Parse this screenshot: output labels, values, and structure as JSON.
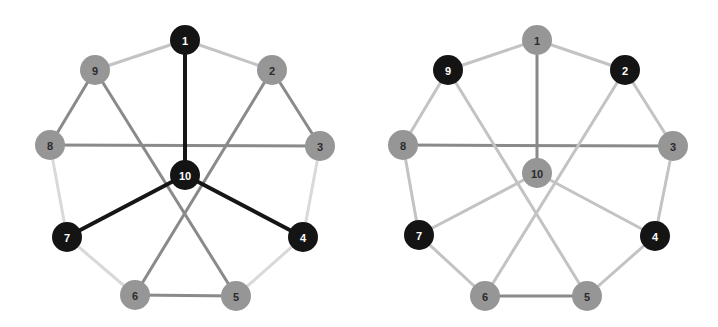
{
  "figure": {
    "title": "",
    "background_color": "#ffffff",
    "width": 718,
    "height": 327,
    "panel_count": 2
  },
  "palette": {
    "node_dark": "#141414",
    "node_gray": "#969696",
    "label_on_dark": "#ffffff",
    "label_on_gray": "#2b2b2b",
    "edge_dark": "#161616",
    "edge_medium": "#8a8a8a",
    "edge_light": "#c3c3c3",
    "edge_faint": "#d9d9d9"
  },
  "chart_data": {
    "type": "diagram",
    "subtype": "node-link-graph",
    "title": "",
    "xlabel": "",
    "ylabel": "",
    "grid": false,
    "legend": null,
    "panels": [
      {
        "panel_id": "left",
        "name": "left-graph",
        "node_radius": 15,
        "nodes": [
          {
            "id": "1",
            "label": "1",
            "x": 185,
            "y": 40,
            "fill": "dark",
            "text": "light"
          },
          {
            "id": "2",
            "label": "2",
            "x": 272,
            "y": 70,
            "fill": "gray",
            "text": "dark"
          },
          {
            "id": "3",
            "label": "3",
            "x": 320,
            "y": 146,
            "fill": "gray",
            "text": "dark"
          },
          {
            "id": "4",
            "label": "4",
            "x": 303,
            "y": 237,
            "fill": "dark",
            "text": "light"
          },
          {
            "id": "5",
            "label": "5",
            "x": 236,
            "y": 296,
            "fill": "gray",
            "text": "dark"
          },
          {
            "id": "6",
            "label": "6",
            "x": 135,
            "y": 295,
            "fill": "gray",
            "text": "dark"
          },
          {
            "id": "7",
            "label": "7",
            "x": 67,
            "y": 237,
            "fill": "dark",
            "text": "light"
          },
          {
            "id": "8",
            "label": "8",
            "x": 50,
            "y": 145,
            "fill": "gray",
            "text": "dark"
          },
          {
            "id": "9",
            "label": "9",
            "x": 95,
            "y": 70,
            "fill": "gray",
            "text": "dark"
          },
          {
            "id": "10",
            "label": "10",
            "x": 185,
            "y": 175,
            "fill": "dark",
            "text": "light"
          }
        ],
        "edges": [
          {
            "from": "1",
            "to": "2",
            "shade": "edge_light",
            "width": 3
          },
          {
            "from": "1",
            "to": "9",
            "shade": "edge_light",
            "width": 3
          },
          {
            "from": "2",
            "to": "3",
            "shade": "edge_medium",
            "width": 3
          },
          {
            "from": "3",
            "to": "4",
            "shade": "edge_faint",
            "width": 3
          },
          {
            "from": "4",
            "to": "5",
            "shade": "edge_faint",
            "width": 3
          },
          {
            "from": "5",
            "to": "6",
            "shade": "edge_medium",
            "width": 3
          },
          {
            "from": "6",
            "to": "7",
            "shade": "edge_faint",
            "width": 3
          },
          {
            "from": "7",
            "to": "8",
            "shade": "edge_faint",
            "width": 3
          },
          {
            "from": "8",
            "to": "9",
            "shade": "edge_medium",
            "width": 3
          },
          {
            "from": "8",
            "to": "3",
            "shade": "edge_medium",
            "width": 3
          },
          {
            "from": "9",
            "to": "5",
            "shade": "edge_medium",
            "width": 3
          },
          {
            "from": "2",
            "to": "6",
            "shade": "edge_medium",
            "width": 3
          },
          {
            "from": "10",
            "to": "1",
            "shade": "edge_dark",
            "width": 4
          },
          {
            "from": "10",
            "to": "4",
            "shade": "edge_dark",
            "width": 4
          },
          {
            "from": "10",
            "to": "7",
            "shade": "edge_dark",
            "width": 4
          }
        ]
      },
      {
        "panel_id": "right",
        "name": "right-graph",
        "node_radius": 15,
        "nodes": [
          {
            "id": "1",
            "label": "1",
            "x": 178,
            "y": 40,
            "fill": "gray",
            "text": "dark"
          },
          {
            "id": "2",
            "label": "2",
            "x": 266,
            "y": 70,
            "fill": "dark",
            "text": "light"
          },
          {
            "id": "3",
            "label": "3",
            "x": 314,
            "y": 146,
            "fill": "gray",
            "text": "dark"
          },
          {
            "id": "4",
            "label": "4",
            "x": 296,
            "y": 236,
            "fill": "dark",
            "text": "light"
          },
          {
            "id": "5",
            "label": "5",
            "x": 228,
            "y": 296,
            "fill": "gray",
            "text": "dark"
          },
          {
            "id": "6",
            "label": "6",
            "x": 126,
            "y": 296,
            "fill": "gray",
            "text": "dark"
          },
          {
            "id": "7",
            "label": "7",
            "x": 60,
            "y": 235,
            "fill": "dark",
            "text": "light"
          },
          {
            "id": "8",
            "label": "8",
            "x": 44,
            "y": 145,
            "fill": "gray",
            "text": "dark"
          },
          {
            "id": "9",
            "label": "9",
            "x": 89,
            "y": 70,
            "fill": "dark",
            "text": "light"
          },
          {
            "id": "10",
            "label": "10",
            "x": 178,
            "y": 173,
            "fill": "gray",
            "text": "dark"
          }
        ],
        "edges": [
          {
            "from": "1",
            "to": "2",
            "shade": "edge_light",
            "width": 3
          },
          {
            "from": "1",
            "to": "9",
            "shade": "edge_light",
            "width": 3
          },
          {
            "from": "2",
            "to": "3",
            "shade": "edge_light",
            "width": 3
          },
          {
            "from": "3",
            "to": "4",
            "shade": "edge_light",
            "width": 3
          },
          {
            "from": "4",
            "to": "5",
            "shade": "edge_light",
            "width": 3
          },
          {
            "from": "5",
            "to": "6",
            "shade": "edge_medium",
            "width": 3
          },
          {
            "from": "6",
            "to": "7",
            "shade": "edge_light",
            "width": 3
          },
          {
            "from": "7",
            "to": "8",
            "shade": "edge_light",
            "width": 3
          },
          {
            "from": "8",
            "to": "9",
            "shade": "edge_light",
            "width": 3
          },
          {
            "from": "8",
            "to": "3",
            "shade": "edge_medium",
            "width": 3
          },
          {
            "from": "9",
            "to": "5",
            "shade": "edge_light",
            "width": 3
          },
          {
            "from": "2",
            "to": "6",
            "shade": "edge_light",
            "width": 3
          },
          {
            "from": "10",
            "to": "1",
            "shade": "edge_medium",
            "width": 3
          },
          {
            "from": "10",
            "to": "4",
            "shade": "edge_light",
            "width": 3
          },
          {
            "from": "10",
            "to": "7",
            "shade": "edge_light",
            "width": 3
          }
        ]
      }
    ]
  }
}
